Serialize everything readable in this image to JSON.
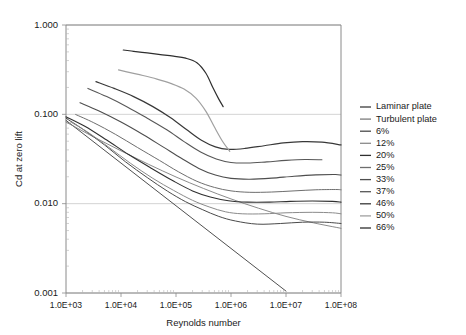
{
  "chart_data": {
    "type": "line",
    "title": "",
    "xlabel": "Reynolds number",
    "ylabel": "Cd at zero lift",
    "xscale": "log",
    "yscale": "log",
    "xlim": [
      1000,
      100000000
    ],
    "ylim": [
      0.001,
      1.0
    ],
    "grid": true,
    "legend_position": "right",
    "xtick_labels": [
      "1.0E+03",
      "1.0E+04",
      "1.0E+05",
      "1.0E+06",
      "1.0E+07",
      "1.0E+08"
    ],
    "xtick_values": [
      1000,
      10000,
      100000,
      1000000,
      10000000,
      100000000
    ],
    "ytick_labels": [
      "1.000",
      "0.100",
      "0.010",
      "0.001"
    ],
    "ytick_values": [
      1.0,
      0.1,
      0.01,
      0.001
    ],
    "series": [
      {
        "name": "Laminar plate",
        "color": "#3b3b3b",
        "width": 0.9,
        "x": [
          1000,
          3000,
          10000,
          31600,
          100000,
          316000,
          1000000,
          3160000,
          10000000
        ],
        "y": [
          0.0855,
          0.0494,
          0.027,
          0.0152,
          0.00855,
          0.00494,
          0.0027,
          0.00152,
          0.00105
        ]
      },
      {
        "name": "Turbulent plate",
        "color": "#7d7d7d",
        "width": 0.9,
        "x": [
          1000,
          3160,
          10000,
          31600,
          100000,
          316000,
          1000000,
          3160000,
          10000000,
          31600000,
          100000000
        ],
        "y": [
          0.082,
          0.056,
          0.039,
          0.0276,
          0.0199,
          0.0148,
          0.0113,
          0.0089,
          0.0072,
          0.0061,
          0.0053
        ]
      },
      {
        "name": "6%",
        "color": "#4a4a4a",
        "width": 1.0,
        "x": [
          1000,
          2000,
          5000,
          12000,
          30000,
          70000,
          150000,
          300000,
          600000,
          1200000,
          3000000,
          8000000,
          20000000,
          50000000,
          100000000
        ],
        "y": [
          0.0905,
          0.0685,
          0.0455,
          0.0295,
          0.0196,
          0.0138,
          0.0105,
          0.0086,
          0.0072,
          0.0064,
          0.0059,
          0.006,
          0.0062,
          0.0062,
          0.006
        ]
      },
      {
        "name": "12%",
        "color": "#8b8b8b",
        "width": 1.0,
        "x": [
          1200,
          2500,
          6000,
          15000,
          38000,
          90000,
          200000,
          400000,
          800000,
          1600000,
          4000000,
          10000000,
          30000000,
          70000000,
          100000000
        ],
        "y": [
          0.0825,
          0.063,
          0.0428,
          0.0282,
          0.0192,
          0.0141,
          0.0109,
          0.0092,
          0.0081,
          0.0077,
          0.0077,
          0.0079,
          0.008,
          0.0079,
          0.0077
        ]
      },
      {
        "name": "20%",
        "color": "#303030",
        "width": 1.1,
        "x": [
          1000,
          2200,
          5500,
          14000,
          36000,
          90000,
          200000,
          420000,
          900000,
          2000000,
          5000000,
          12000000,
          30000000,
          70000000,
          100000000
        ],
        "y": [
          0.094,
          0.0735,
          0.0515,
          0.0352,
          0.0248,
          0.0179,
          0.0139,
          0.0119,
          0.0108,
          0.0104,
          0.0104,
          0.0106,
          0.0107,
          0.0106,
          0.0104
        ]
      },
      {
        "name": "25%",
        "color": "#6e6e6e",
        "width": 1.0,
        "x": [
          1500,
          3200,
          8000,
          20000,
          50000,
          110000,
          240000,
          500000,
          1000000,
          2200000,
          5500000,
          14000000,
          35000000,
          80000000,
          100000000
        ],
        "y": [
          0.0995,
          0.0805,
          0.0595,
          0.0425,
          0.0305,
          0.0228,
          0.0178,
          0.0152,
          0.0139,
          0.0134,
          0.0135,
          0.0139,
          0.0143,
          0.0144,
          0.0143
        ]
      },
      {
        "name": "33%",
        "color": "#4e4e4e",
        "width": 1.1,
        "x": [
          1800,
          4000,
          10000,
          25000,
          58000,
          125000,
          260000,
          520000,
          1000000,
          2200000,
          5500000,
          14000000,
          35000000,
          80000000,
          100000000
        ],
        "y": [
          0.135,
          0.109,
          0.082,
          0.0595,
          0.0432,
          0.0322,
          0.0248,
          0.0209,
          0.0192,
          0.0188,
          0.0193,
          0.0203,
          0.021,
          0.0212,
          0.0209
        ]
      },
      {
        "name": "37%",
        "color": "#575757",
        "width": 1.1,
        "x": [
          2500,
          5500,
          13000,
          30000,
          68000,
          140000,
          280000,
          540000,
          1000000,
          2000000,
          4500000,
          10000000,
          22000000,
          45000000
        ],
        "y": [
          0.195,
          0.158,
          0.121,
          0.0905,
          0.0672,
          0.0495,
          0.0378,
          0.0316,
          0.0289,
          0.0285,
          0.0294,
          0.0305,
          0.0312,
          0.031
        ]
      },
      {
        "name": "46%",
        "color": "#383838",
        "width": 1.2,
        "x": [
          3500,
          7500,
          17000,
          38000,
          80000,
          155000,
          290000,
          520000,
          900000,
          1800000,
          4000000,
          9000000,
          20000000,
          45000000,
          100000000
        ],
        "y": [
          0.232,
          0.195,
          0.158,
          0.122,
          0.0915,
          0.0675,
          0.0512,
          0.0432,
          0.0405,
          0.0415,
          0.0445,
          0.0478,
          0.0495,
          0.0488,
          0.0455
        ]
      },
      {
        "name": "50%",
        "color": "#a0a0a0",
        "width": 1.2,
        "x": [
          9000,
          14000,
          25000,
          45000,
          80000,
          140000,
          230000,
          350000,
          500000,
          700000,
          950000
        ],
        "y": [
          0.315,
          0.295,
          0.272,
          0.248,
          0.222,
          0.192,
          0.152,
          0.108,
          0.072,
          0.05,
          0.0385
        ]
      },
      {
        "name": "66%",
        "color": "#2e2e2e",
        "width": 1.2,
        "x": [
          11000,
          17000,
          30000,
          52000,
          90000,
          150000,
          240000,
          350000,
          470000,
          600000,
          720000
        ],
        "y": [
          0.525,
          0.508,
          0.487,
          0.467,
          0.448,
          0.425,
          0.378,
          0.288,
          0.198,
          0.148,
          0.122
        ]
      }
    ]
  }
}
